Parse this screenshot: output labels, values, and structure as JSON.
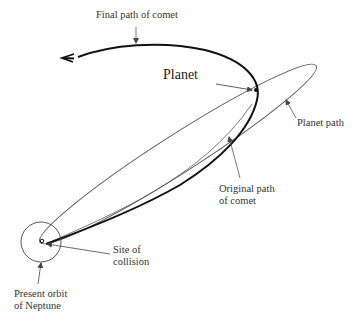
{
  "diagram": {
    "type": "orbital-paths",
    "labels": {
      "final_path": "Final path of comet",
      "planet": "Planet",
      "planet_path": "Planet path",
      "original_path_line1": "Original path",
      "original_path_line2": "of comet",
      "collision_line1": "Site of",
      "collision_line2": "collision",
      "neptune_line1": "Present orbit",
      "neptune_line2": "of Neptune"
    },
    "colors": {
      "background": "#ffffff",
      "line": "#1a1a1a",
      "thin_line": "#555555",
      "text": "#333333"
    },
    "elements": [
      {
        "name": "final-path-of-comet",
        "style": "thick",
        "arrowhead": "left"
      },
      {
        "name": "planet-path",
        "style": "thin-ellipse"
      },
      {
        "name": "original-path-of-comet",
        "style": "thin"
      },
      {
        "name": "neptune-orbit",
        "style": "circle"
      },
      {
        "name": "planet",
        "style": "dot"
      },
      {
        "name": "collision-site",
        "style": "small-circle"
      }
    ]
  }
}
